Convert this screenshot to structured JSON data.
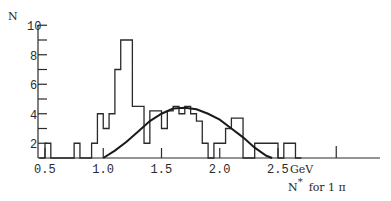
{
  "chart_data": {
    "type": "bar",
    "title": "",
    "ylabel": "N",
    "xlabel": "N* for 1 π",
    "x_unit": "GeV",
    "ylim": [
      1,
      10
    ],
    "xlim": [
      0.45,
      3.05
    ],
    "yticks": [
      2,
      4,
      6,
      8,
      10
    ],
    "xticks": [
      "0.5",
      "1.0",
      "1.5",
      "2.0",
      "2.5"
    ],
    "grid": false,
    "histogram": {
      "bin_edges": [
        0.45,
        0.5,
        0.55,
        0.75,
        0.8,
        0.9,
        0.95,
        1.0,
        1.05,
        1.1,
        1.15,
        1.25,
        1.35,
        1.4,
        1.45,
        1.5,
        1.55,
        1.6,
        1.65,
        1.7,
        1.75,
        1.8,
        1.85,
        1.9,
        1.95,
        2.05,
        2.1,
        2.15,
        2.2,
        2.3,
        2.5,
        2.55,
        2.65,
        2.7
      ],
      "values": [
        1,
        2,
        1,
        2,
        1,
        2,
        4,
        3,
        4,
        7,
        9,
        4.5,
        2,
        4.2,
        4.2,
        3,
        4.2,
        4.5,
        4,
        4.5,
        4,
        3.5,
        2,
        1,
        2,
        3,
        3.7,
        3.7,
        1,
        2,
        1,
        2,
        1
      ]
    },
    "curve": {
      "name": "fit",
      "x": [
        1.0,
        1.1,
        1.2,
        1.3,
        1.4,
        1.5,
        1.6,
        1.7,
        1.8,
        1.9,
        2.0,
        2.1,
        2.2,
        2.3,
        2.4,
        2.45
      ],
      "y": [
        1.0,
        1.5,
        2.1,
        2.8,
        3.5,
        4.0,
        4.35,
        4.4,
        4.3,
        4.0,
        3.6,
        3.0,
        2.4,
        1.7,
        1.15,
        1.0
      ]
    },
    "legend": null
  },
  "labels": {
    "y_axis": "N",
    "x_unit": "GeV",
    "x_caption_main": "N",
    "x_caption_sup": "*",
    "x_caption_rest": "for 1 π"
  }
}
